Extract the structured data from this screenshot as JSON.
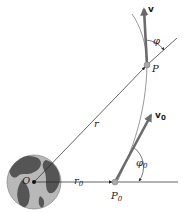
{
  "diagram": {
    "type": "orbital-mechanics",
    "labels": {
      "origin": "O",
      "radius": "r",
      "initial_radius": "r",
      "initial_radius_sub": "0",
      "initial_point": "P",
      "initial_point_sub": "0",
      "point": "P",
      "velocity": "v",
      "initial_velocity": "v",
      "initial_velocity_sub": "0",
      "angle": "φ",
      "initial_angle": "φ",
      "initial_angle_sub": "0"
    },
    "colors": {
      "arrow": "#6b6b6b",
      "line": "#222222",
      "trajectory": "#9a9a9a",
      "earth_ocean": "#b5b5b5",
      "earth_land": "#555555",
      "point": "#a8a8a8"
    }
  }
}
